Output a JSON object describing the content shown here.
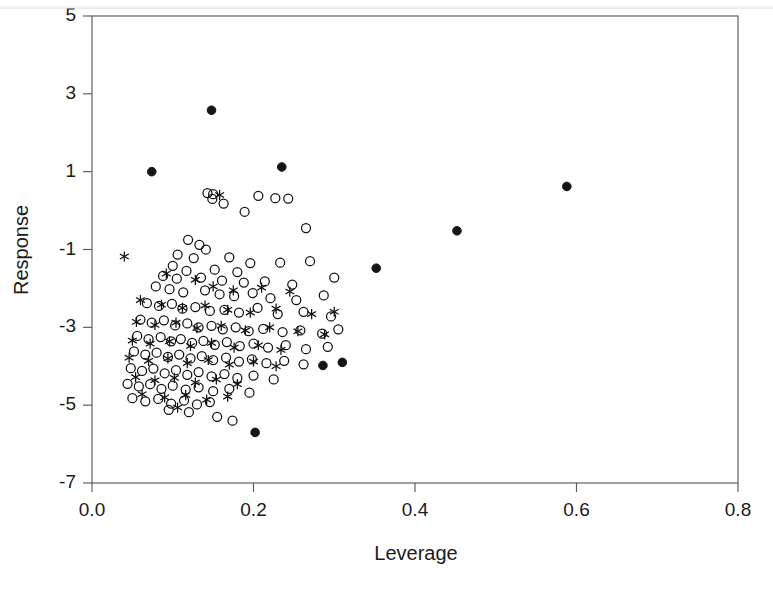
{
  "figure": {
    "title": "",
    "background_color": "#ffffff",
    "frame_color": "#5b5b5b"
  },
  "chart_data": {
    "type": "scatter",
    "title": "",
    "xlabel": "Leverage",
    "ylabel": "Response",
    "xlim": [
      0.0,
      0.8
    ],
    "ylim": [
      -7,
      5
    ],
    "grid": false,
    "legend": "none",
    "xticks": [
      0.0,
      0.2,
      0.4,
      0.6,
      0.8
    ],
    "xticklabels": [
      "0.0",
      "0.2",
      "0.4",
      "0.6",
      "0.8"
    ],
    "yticks": [
      5,
      3,
      1,
      -1,
      -3,
      -5,
      -7
    ],
    "yticklabels": [
      "5",
      "3",
      "1",
      "-1",
      "-3",
      "-5",
      "-7"
    ],
    "marker_colors": {
      "open": "#111111",
      "filled": "#151515",
      "star": "#111111"
    },
    "series": [
      {
        "name": "open-circle",
        "marker": "o",
        "fill": "none",
        "points": [
          [
            0.143,
            0.45
          ],
          [
            0.15,
            0.42
          ],
          [
            0.149,
            0.3
          ],
          [
            0.163,
            0.18
          ],
          [
            0.206,
            0.38
          ],
          [
            0.227,
            0.32
          ],
          [
            0.243,
            0.31
          ],
          [
            0.189,
            -0.03
          ],
          [
            0.265,
            -0.45
          ],
          [
            0.119,
            -0.75
          ],
          [
            0.133,
            -0.88
          ],
          [
            0.141,
            -1.0
          ],
          [
            0.106,
            -1.13
          ],
          [
            0.126,
            -1.22
          ],
          [
            0.17,
            -1.2
          ],
          [
            0.196,
            -1.35
          ],
          [
            0.1,
            -1.42
          ],
          [
            0.117,
            -1.55
          ],
          [
            0.152,
            -1.52
          ],
          [
            0.18,
            -1.58
          ],
          [
            0.233,
            -1.34
          ],
          [
            0.27,
            -1.3
          ],
          [
            0.088,
            -1.68
          ],
          [
            0.105,
            -1.75
          ],
          [
            0.135,
            -1.72
          ],
          [
            0.161,
            -1.8
          ],
          [
            0.188,
            -1.85
          ],
          [
            0.214,
            -1.82
          ],
          [
            0.248,
            -1.9
          ],
          [
            0.3,
            -1.72
          ],
          [
            0.079,
            -1.95
          ],
          [
            0.096,
            -2.02
          ],
          [
            0.113,
            -2.1
          ],
          [
            0.14,
            -2.05
          ],
          [
            0.158,
            -2.15
          ],
          [
            0.176,
            -2.2
          ],
          [
            0.199,
            -2.12
          ],
          [
            0.221,
            -2.25
          ],
          [
            0.253,
            -2.3
          ],
          [
            0.287,
            -2.18
          ],
          [
            0.068,
            -2.38
          ],
          [
            0.083,
            -2.45
          ],
          [
            0.099,
            -2.4
          ],
          [
            0.112,
            -2.52
          ],
          [
            0.128,
            -2.48
          ],
          [
            0.146,
            -2.58
          ],
          [
            0.164,
            -2.55
          ],
          [
            0.182,
            -2.62
          ],
          [
            0.205,
            -2.5
          ],
          [
            0.23,
            -2.66
          ],
          [
            0.262,
            -2.6
          ],
          [
            0.296,
            -2.72
          ],
          [
            0.06,
            -2.8
          ],
          [
            0.074,
            -2.88
          ],
          [
            0.089,
            -2.82
          ],
          [
            0.103,
            -2.95
          ],
          [
            0.118,
            -2.9
          ],
          [
            0.132,
            -3.0
          ],
          [
            0.148,
            -2.96
          ],
          [
            0.162,
            -3.05
          ],
          [
            0.178,
            -3.0
          ],
          [
            0.194,
            -3.1
          ],
          [
            0.212,
            -3.04
          ],
          [
            0.236,
            -3.12
          ],
          [
            0.258,
            -3.08
          ],
          [
            0.285,
            -3.16
          ],
          [
            0.305,
            -3.05
          ],
          [
            0.056,
            -3.22
          ],
          [
            0.07,
            -3.3
          ],
          [
            0.085,
            -3.25
          ],
          [
            0.098,
            -3.36
          ],
          [
            0.11,
            -3.3
          ],
          [
            0.124,
            -3.4
          ],
          [
            0.138,
            -3.35
          ],
          [
            0.152,
            -3.45
          ],
          [
            0.167,
            -3.38
          ],
          [
            0.183,
            -3.48
          ],
          [
            0.2,
            -3.42
          ],
          [
            0.218,
            -3.52
          ],
          [
            0.24,
            -3.46
          ],
          [
            0.265,
            -3.56
          ],
          [
            0.292,
            -3.5
          ],
          [
            0.052,
            -3.62
          ],
          [
            0.066,
            -3.7
          ],
          [
            0.08,
            -3.65
          ],
          [
            0.094,
            -3.76
          ],
          [
            0.108,
            -3.7
          ],
          [
            0.122,
            -3.8
          ],
          [
            0.136,
            -3.74
          ],
          [
            0.15,
            -3.84
          ],
          [
            0.166,
            -3.78
          ],
          [
            0.182,
            -3.88
          ],
          [
            0.198,
            -3.82
          ],
          [
            0.216,
            -3.92
          ],
          [
            0.238,
            -3.86
          ],
          [
            0.262,
            -3.95
          ],
          [
            0.048,
            -4.05
          ],
          [
            0.062,
            -4.12
          ],
          [
            0.076,
            -4.06
          ],
          [
            0.09,
            -4.18
          ],
          [
            0.104,
            -4.1
          ],
          [
            0.118,
            -4.22
          ],
          [
            0.132,
            -4.15
          ],
          [
            0.148,
            -4.26
          ],
          [
            0.164,
            -4.2
          ],
          [
            0.18,
            -4.3
          ],
          [
            0.2,
            -4.24
          ],
          [
            0.225,
            -4.34
          ],
          [
            0.044,
            -4.45
          ],
          [
            0.058,
            -4.52
          ],
          [
            0.072,
            -4.46
          ],
          [
            0.086,
            -4.58
          ],
          [
            0.1,
            -4.5
          ],
          [
            0.116,
            -4.6
          ],
          [
            0.132,
            -4.54
          ],
          [
            0.15,
            -4.64
          ],
          [
            0.17,
            -4.58
          ],
          [
            0.195,
            -4.68
          ],
          [
            0.05,
            -4.82
          ],
          [
            0.066,
            -4.9
          ],
          [
            0.082,
            -4.84
          ],
          [
            0.098,
            -4.96
          ],
          [
            0.114,
            -4.88
          ],
          [
            0.13,
            -4.98
          ],
          [
            0.146,
            -4.92
          ],
          [
            0.095,
            -5.12
          ],
          [
            0.12,
            -5.18
          ],
          [
            0.155,
            -5.3
          ],
          [
            0.174,
            -5.4
          ]
        ]
      },
      {
        "name": "star",
        "marker": "*",
        "points": [
          [
            0.158,
            0.4
          ],
          [
            0.04,
            -1.18
          ],
          [
            0.092,
            -1.62
          ],
          [
            0.128,
            -1.78
          ],
          [
            0.15,
            -1.95
          ],
          [
            0.175,
            -2.05
          ],
          [
            0.21,
            -1.98
          ],
          [
            0.245,
            -2.08
          ],
          [
            0.06,
            -2.3
          ],
          [
            0.086,
            -2.42
          ],
          [
            0.112,
            -2.5
          ],
          [
            0.14,
            -2.44
          ],
          [
            0.168,
            -2.55
          ],
          [
            0.196,
            -2.62
          ],
          [
            0.228,
            -2.52
          ],
          [
            0.272,
            -2.66
          ],
          [
            0.3,
            -2.6
          ],
          [
            0.055,
            -2.86
          ],
          [
            0.078,
            -2.94
          ],
          [
            0.104,
            -2.88
          ],
          [
            0.13,
            -3.02
          ],
          [
            0.16,
            -2.96
          ],
          [
            0.19,
            -3.08
          ],
          [
            0.22,
            -3.0
          ],
          [
            0.255,
            -3.1
          ],
          [
            0.288,
            -3.18
          ],
          [
            0.05,
            -3.34
          ],
          [
            0.072,
            -3.42
          ],
          [
            0.096,
            -3.36
          ],
          [
            0.122,
            -3.48
          ],
          [
            0.148,
            -3.4
          ],
          [
            0.176,
            -3.52
          ],
          [
            0.206,
            -3.46
          ],
          [
            0.234,
            -3.58
          ],
          [
            0.046,
            -3.78
          ],
          [
            0.07,
            -3.86
          ],
          [
            0.094,
            -3.8
          ],
          [
            0.118,
            -3.92
          ],
          [
            0.144,
            -3.84
          ],
          [
            0.17,
            -3.96
          ],
          [
            0.2,
            -3.88
          ],
          [
            0.228,
            -4.0
          ],
          [
            0.054,
            -4.28
          ],
          [
            0.078,
            -4.36
          ],
          [
            0.102,
            -4.3
          ],
          [
            0.128,
            -4.42
          ],
          [
            0.154,
            -4.34
          ],
          [
            0.18,
            -4.46
          ],
          [
            0.062,
            -4.72
          ],
          [
            0.09,
            -4.8
          ],
          [
            0.116,
            -4.74
          ],
          [
            0.142,
            -4.86
          ],
          [
            0.168,
            -4.78
          ],
          [
            0.106,
            -5.06
          ]
        ]
      },
      {
        "name": "filled-circle",
        "marker": "o",
        "fill": "solid",
        "points": [
          [
            0.148,
            2.58
          ],
          [
            0.074,
            1.0
          ],
          [
            0.235,
            1.12
          ],
          [
            0.588,
            0.62
          ],
          [
            0.452,
            -0.52
          ],
          [
            0.352,
            -1.48
          ],
          [
            0.286,
            -3.98
          ],
          [
            0.31,
            -3.9
          ],
          [
            0.202,
            -5.7
          ]
        ]
      }
    ]
  }
}
